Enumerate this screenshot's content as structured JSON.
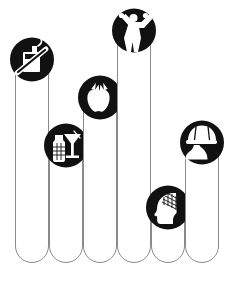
{
  "canvas": {
    "width": 238,
    "height": 284,
    "background": "#ffffff",
    "title": "Health Factors Bar Infographic"
  },
  "style": {
    "bar_fill": "#ffffff",
    "bar_stroke": "#8a8a8a",
    "badge_fill": "#111111",
    "glyph_fill": "#ffffff"
  },
  "chart_data": {
    "type": "bar",
    "title": "",
    "subtitle": "",
    "xlabel": "",
    "ylabel": "",
    "grid": false,
    "legend": "none",
    "orientation": "vertical",
    "baseline_y": 262,
    "bar_width": 33,
    "ylim": [
      0,
      100
    ],
    "categories": [
      "No Smoking",
      "Alcohol",
      "Nutrition",
      "Exercise",
      "Mental Health",
      "Safety"
    ],
    "values": [
      88,
      54,
      74,
      101,
      29,
      56
    ],
    "bars": [
      {
        "index": 1,
        "category": "No Smoking",
        "icon": "no-smoking-icon",
        "x": 15,
        "top_y": 42,
        "value": 88
      },
      {
        "index": 2,
        "category": "Alcohol",
        "icon": "alcohol-drinks-icon",
        "x": 49,
        "top_y": 128,
        "value": 54
      },
      {
        "index": 3,
        "category": "Nutrition",
        "icon": "apple-icon",
        "x": 83,
        "top_y": 80,
        "value": 74
      },
      {
        "index": 4,
        "category": "Exercise",
        "icon": "person-exercising-icon",
        "x": 117,
        "top_y": 13,
        "value": 101
      },
      {
        "index": 5,
        "category": "Mental Health",
        "icon": "head-brain-icon",
        "x": 151,
        "top_y": 190,
        "value": 29
      },
      {
        "index": 6,
        "category": "Safety",
        "icon": "helmet-person-icon",
        "x": 185,
        "top_y": 125,
        "value": 56
      }
    ]
  }
}
